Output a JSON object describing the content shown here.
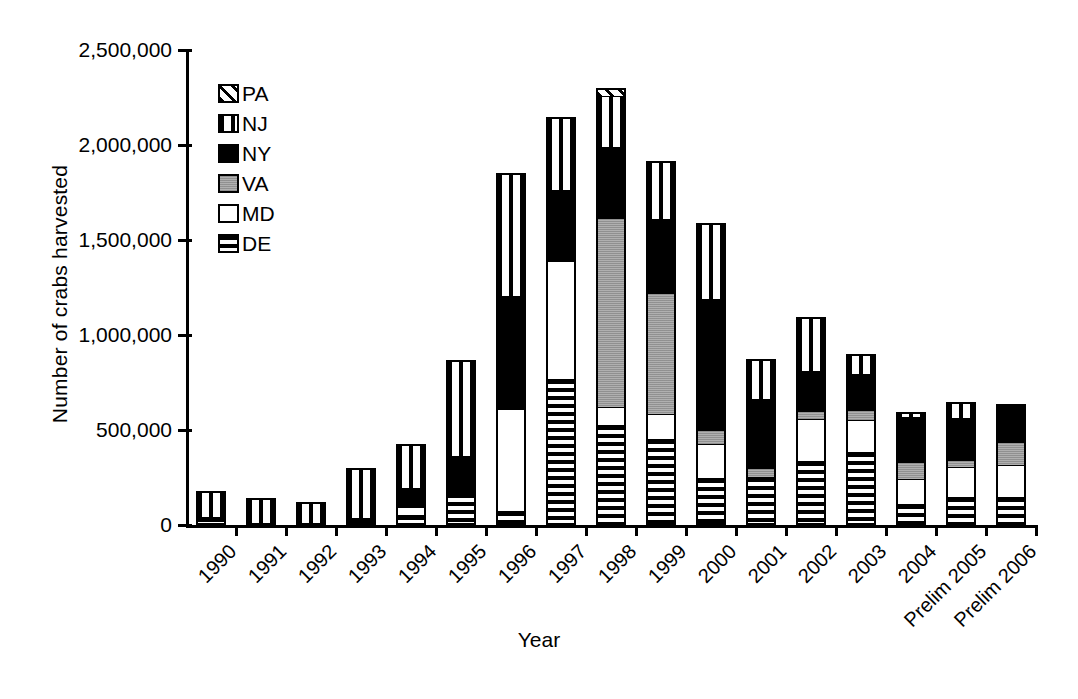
{
  "chart_data": {
    "type": "bar",
    "subtype": "stacked",
    "title": "",
    "xlabel": "Year",
    "ylabel": "Number of crabs harvested",
    "ylim": [
      0,
      2500000
    ],
    "ytick_labels": [
      "0",
      "500,000",
      "1,000,000",
      "1,500,000",
      "2,000,000",
      "2,500,000"
    ],
    "ytick_values": [
      0,
      500000,
      1000000,
      1500000,
      2000000,
      2500000
    ],
    "grid": false,
    "legend_position": "upper-left-inside",
    "categories": [
      "1990",
      "1991",
      "1992",
      "1993",
      "1994",
      "1995",
      "1996",
      "1997",
      "1998",
      "1999",
      "2000",
      "2001",
      "2002",
      "2003",
      "2004",
      "Prelim 2005",
      "Prelim 2006"
    ],
    "series": [
      {
        "name": "DE",
        "pattern": "horizontal-stripes",
        "values": [
          30000,
          0,
          0,
          25000,
          40000,
          155000,
          60000,
          760000,
          515000,
          440000,
          235000,
          245000,
          325000,
          375000,
          100000,
          135000,
          135000
        ]
      },
      {
        "name": "MD",
        "pattern": "white",
        "values": [
          0,
          0,
          0,
          0,
          45000,
          0,
          540000,
          625000,
          95000,
          135000,
          180000,
          0,
          230000,
          175000,
          135000,
          165000,
          175000
        ]
      },
      {
        "name": "VA",
        "pattern": "gray",
        "values": [
          0,
          0,
          0,
          0,
          0,
          0,
          0,
          0,
          1005000,
          645000,
          75000,
          45000,
          40000,
          55000,
          95000,
          40000,
          125000
        ]
      },
      {
        "name": "NY",
        "pattern": "solid-black",
        "values": [
          0,
          0,
          0,
          0,
          105000,
          200000,
          605000,
          380000,
          375000,
          390000,
          700000,
          375000,
          215000,
          195000,
          245000,
          225000,
          200000
        ]
      },
      {
        "name": "NJ",
        "pattern": "vertical-stripes",
        "values": [
          150000,
          140000,
          120000,
          275000,
          235000,
          515000,
          650000,
          380000,
          275000,
          305000,
          400000,
          210000,
          285000,
          100000,
          20000,
          80000,
          0
        ]
      },
      {
        "name": "PA",
        "pattern": "diagonal-hatch",
        "values": [
          0,
          0,
          0,
          0,
          0,
          0,
          0,
          0,
          35000,
          0,
          0,
          0,
          0,
          0,
          0,
          0,
          0
        ]
      }
    ],
    "totals": [
      180000,
      140000,
      120000,
      300000,
      425000,
      870000,
      1855000,
      2145000,
      2300000,
      1915000,
      1590000,
      875000,
      1095000,
      900000,
      595000,
      645000,
      635000
    ]
  },
  "legend": {
    "items": [
      {
        "label": "PA",
        "pattern": "diagonal-hatch"
      },
      {
        "label": "NJ",
        "pattern": "vertical-stripes"
      },
      {
        "label": "NY",
        "pattern": "solid-black"
      },
      {
        "label": "VA",
        "pattern": "gray"
      },
      {
        "label": "MD",
        "pattern": "white"
      },
      {
        "label": "DE",
        "pattern": "horizontal-stripes"
      }
    ]
  }
}
